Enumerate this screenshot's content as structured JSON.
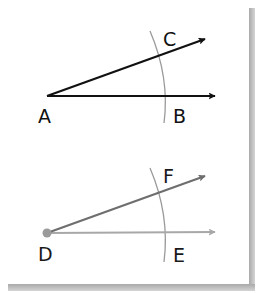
{
  "diagram": {
    "type": "angle-copy-construction",
    "original_angle": {
      "vertex": "A",
      "ray_points": [
        "B",
        "C"
      ],
      "labels": {
        "vertex": "A",
        "base": "B",
        "upper": "C"
      },
      "stroke_color": "#111111",
      "arc_color": "#9a9a9a"
    },
    "copied_angle": {
      "vertex": "D",
      "ray_points": [
        "E",
        "F"
      ],
      "labels": {
        "vertex": "D",
        "base": "E",
        "upper": "F"
      },
      "upper_ray_color": "#6e6e6e",
      "base_ray_color": "#a8a8a8",
      "vertex_dot_color": "#9a9a9a",
      "arc_color": "#9a9a9a"
    },
    "card": {
      "background": "#ffffff",
      "shadow_color": "#b5b5b5"
    }
  }
}
